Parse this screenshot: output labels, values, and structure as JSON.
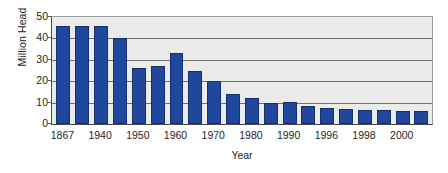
{
  "chart_data": {
    "type": "bar",
    "title": "",
    "subtitle": "",
    "xlabel": "Year",
    "ylabel": "Million Head",
    "ylim": [
      0,
      50
    ],
    "yticks": [
      0,
      10,
      20,
      30,
      40,
      50
    ],
    "ytick_labels": [
      "0",
      "10",
      "20",
      "30",
      "40",
      "50"
    ],
    "grid": true,
    "legend": false,
    "legend_position": "none",
    "bar_color": "#1F479B",
    "plot_background": "#EBEBE9",
    "axis_color": "#4A4A4A",
    "categories": [
      "1867",
      "",
      "1940",
      "",
      "1950",
      "",
      "1960",
      "",
      "1970",
      "",
      "1980",
      "",
      "1990",
      "",
      "1996",
      "",
      "1998",
      "",
      "2000",
      ""
    ],
    "xtick_labels": [
      "1867",
      "1940",
      "1950",
      "1960",
      "1970",
      "1980",
      "1990",
      "1996",
      "1998",
      "2000"
    ],
    "values": [
      46,
      46,
      46,
      40,
      26,
      27,
      33,
      25,
      20,
      14,
      12,
      10,
      10.5,
      8.5,
      7.5,
      7,
      6.5,
      6.5,
      6,
      6
    ],
    "series": [
      {
        "name": "Million Head",
        "values": [
          46,
          46,
          46,
          40,
          26,
          27,
          33,
          25,
          20,
          14,
          12,
          10,
          10.5,
          8.5,
          7.5,
          7,
          6.5,
          6.5,
          6,
          6
        ]
      }
    ]
  }
}
